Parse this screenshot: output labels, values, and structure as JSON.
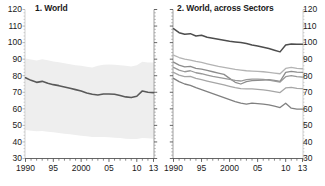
{
  "figure": {
    "background_color": "#ffffff",
    "text_color": "#1a1a1a"
  },
  "chart_data": [
    {
      "type": "line",
      "panel_id": "1",
      "title": "1. World",
      "xlabel": "",
      "ylabel": "",
      "xlim": [
        1990,
        2013
      ],
      "ylim": [
        30,
        120
      ],
      "grid": false,
      "legend": "none",
      "y_axis_position": "left",
      "yticks": [
        30,
        40,
        50,
        60,
        70,
        80,
        90,
        100,
        110,
        120
      ],
      "ytick_labels": [
        "30",
        "40",
        "50",
        "60",
        "70",
        "80",
        "90",
        "100",
        "110",
        "120"
      ],
      "xticks": [
        1990,
        1995,
        2000,
        2005,
        2010,
        2013
      ],
      "xtick_labels": [
        "1990",
        "95",
        "2000",
        "05",
        "10",
        "13"
      ],
      "x": [
        1990,
        1991,
        1992,
        1993,
        1994,
        1995,
        1996,
        1997,
        1998,
        1999,
        2000,
        2001,
        2002,
        2003,
        2004,
        2005,
        2006,
        2007,
        2008,
        2009,
        2010,
        2011,
        2012,
        2013
      ],
      "series": [
        {
          "name": "World median",
          "color": "#595959",
          "width": 1.6,
          "values": [
            78.8,
            77.2,
            76.0,
            76.6,
            75.4,
            74.6,
            74.0,
            73.2,
            72.4,
            71.6,
            70.8,
            69.6,
            68.8,
            68.4,
            69.0,
            69.0,
            68.8,
            68.0,
            67.2,
            66.8,
            67.6,
            70.8,
            70.0,
            69.8
          ]
        }
      ],
      "band": {
        "name": "Interquartile range",
        "fill_color": "#eeeeee",
        "upper": [
          90.4,
          89.8,
          89.2,
          90.0,
          89.4,
          88.6,
          88.2,
          87.6,
          87.0,
          86.4,
          86.0,
          85.4,
          85.0,
          86.0,
          86.6,
          86.8,
          86.6,
          86.4,
          86.0,
          85.6,
          86.4,
          88.4,
          88.0,
          88.0
        ],
        "lower": [
          47.2,
          46.8,
          46.4,
          46.6,
          46.2,
          45.8,
          45.4,
          45.0,
          44.6,
          44.2,
          43.8,
          43.4,
          43.0,
          43.0,
          43.0,
          42.8,
          42.6,
          42.4,
          42.0,
          41.8,
          41.8,
          42.4,
          42.2,
          42.0
        ]
      }
    },
    {
      "type": "line",
      "panel_id": "2",
      "title": "2. World, across Sectors",
      "xlabel": "",
      "ylabel": "",
      "xlim": [
        1990,
        2013
      ],
      "ylim": [
        30,
        120
      ],
      "grid": false,
      "legend": "none",
      "y_axis_position": "right",
      "yticks": [
        30,
        40,
        50,
        60,
        70,
        80,
        90,
        100,
        110,
        120
      ],
      "ytick_labels": [
        "30",
        "40",
        "50",
        "60",
        "70",
        "80",
        "90",
        "100",
        "110",
        "120"
      ],
      "xticks": [
        1990,
        1995,
        2000,
        2005,
        2010,
        2013
      ],
      "xtick_labels": [
        "1990",
        "95",
        "2000",
        "05",
        "10",
        "13"
      ],
      "x": [
        1990,
        1991,
        1992,
        1993,
        1994,
        1995,
        1996,
        1997,
        1998,
        1999,
        2000,
        2001,
        2002,
        2003,
        2004,
        2005,
        2006,
        2007,
        2008,
        2009,
        2010,
        2011,
        2012,
        2013
      ],
      "series": [
        {
          "name": "Sector 1",
          "color": "#4d4d4d",
          "width": 1.5,
          "values": [
            108.4,
            106.0,
            105.0,
            105.4,
            104.0,
            104.4,
            103.2,
            102.6,
            102.0,
            101.4,
            100.8,
            100.4,
            100.0,
            99.4,
            98.6,
            98.0,
            97.2,
            96.4,
            95.4,
            94.4,
            98.6,
            99.2,
            99.0,
            99.0
          ]
        },
        {
          "name": "Sector 2",
          "color": "#b3b3b3",
          "width": 1.3,
          "values": [
            92.4,
            91.0,
            90.0,
            89.4,
            88.6,
            88.0,
            87.2,
            86.4,
            85.6,
            85.0,
            84.4,
            83.8,
            83.4,
            83.0,
            82.8,
            82.6,
            82.4,
            82.0,
            81.6,
            81.2,
            84.4,
            85.0,
            84.4,
            84.2
          ]
        },
        {
          "name": "Sector 3",
          "color": "#8c8c8c",
          "width": 1.3,
          "values": [
            88.2,
            86.4,
            85.4,
            85.6,
            84.4,
            84.0,
            83.2,
            82.4,
            81.6,
            80.8,
            78.4,
            76.0,
            75.0,
            76.4,
            77.0,
            77.2,
            77.4,
            77.6,
            77.2,
            76.6,
            82.0,
            82.6,
            82.2,
            82.0
          ]
        },
        {
          "name": "Sector 4",
          "color": "#999999",
          "width": 1.3,
          "values": [
            85.0,
            83.4,
            82.4,
            83.0,
            81.8,
            81.2,
            80.4,
            79.6,
            79.0,
            78.4,
            77.8,
            77.2,
            76.8,
            77.6,
            78.0,
            78.0,
            77.8,
            77.4,
            76.8,
            76.2,
            79.4,
            80.0,
            79.4,
            79.2
          ]
        },
        {
          "name": "Sector 5",
          "color": "#a6a6a6",
          "width": 1.3,
          "values": [
            82.0,
            80.4,
            79.4,
            79.6,
            78.4,
            77.6,
            76.8,
            76.0,
            75.2,
            74.4,
            73.6,
            72.8,
            72.2,
            72.0,
            72.0,
            71.8,
            71.4,
            71.0,
            70.4,
            69.8,
            72.6,
            73.0,
            72.4,
            72.2
          ]
        },
        {
          "name": "Sector 6",
          "color": "#808080",
          "width": 1.3,
          "values": [
            78.4,
            76.4,
            75.0,
            74.2,
            72.8,
            71.6,
            70.4,
            69.2,
            68.0,
            66.8,
            65.6,
            64.4,
            63.4,
            62.8,
            63.4,
            63.2,
            62.8,
            62.4,
            61.6,
            60.8,
            63.4,
            60.4,
            59.8,
            59.8
          ]
        }
      ]
    }
  ]
}
